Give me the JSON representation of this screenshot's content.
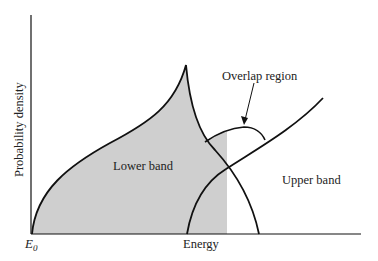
{
  "diagram": {
    "y_axis_label": "Probability density",
    "x_axis_label": "Energy",
    "origin_label": "E",
    "origin_subscript": "0",
    "regions": {
      "lower_band": "Lower band",
      "upper_band": "Upper band",
      "overlap": "Overlap region"
    },
    "colors": {
      "shade": "#cfcfcf",
      "line": "#111111",
      "text": "#222222"
    }
  }
}
